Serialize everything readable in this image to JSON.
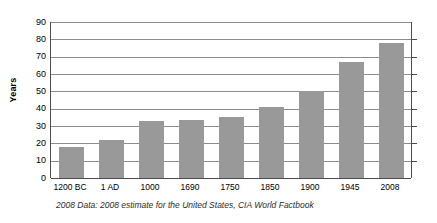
{
  "chart_data": {
    "type": "bar",
    "title": "",
    "subtitle": "",
    "xlabel": "",
    "ylabel": "Years",
    "categories": [
      "1200 BC",
      "1 AD",
      "1000",
      "1690",
      "1750",
      "1850",
      "1900",
      "1945",
      "2008"
    ],
    "values": [
      18,
      22,
      33,
      33.5,
      35,
      41,
      50,
      67,
      78
    ],
    "ylim": [
      0,
      90
    ],
    "ytick_step": 10,
    "yticks": [
      0,
      10,
      20,
      30,
      40,
      50,
      60,
      70,
      80,
      90
    ],
    "ytick_labels": [
      "0",
      "10",
      "20",
      "30",
      "40",
      "50",
      "60",
      "70",
      "80",
      "90"
    ],
    "grid": true,
    "grid_axis": "y",
    "legend": false,
    "legend_position": "none",
    "annotations": [
      "2008 Data: 2008 estimate for the United States, CIA World Factbook"
    ],
    "bar_color": "#999999",
    "gridline_color": "#8c8c8c",
    "axis_color": "#4d4d4d",
    "background_color": "#ffffff"
  },
  "footnote": {
    "text": "2008 Data: 2008 estimate for the United States, CIA World Factbook"
  }
}
